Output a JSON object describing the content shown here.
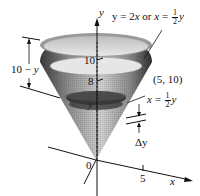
{
  "diagram": {
    "type": "solid-of-revolution-cone",
    "colors": {
      "background": "#ffffff",
      "ink": "#111111",
      "cone_dark": "#3a3a3a",
      "cone_mid": "#8a8a8a",
      "cone_light": "#cfcfcf",
      "disk_top": "#e6e6e6",
      "slice": "#262626"
    },
    "axes": {
      "y_label": "y",
      "x_label": "x",
      "origin_label": "0",
      "y_ticks": [
        "8",
        "10"
      ],
      "x_ticks": [
        "5"
      ]
    },
    "labels": {
      "line_eq_lhs": "y = 2",
      "line_eq_x": "x",
      "line_eq_or": " or ",
      "line_eq_x2": "x",
      "line_eq_eq": " = ",
      "line_eq_num": "1",
      "line_eq_den": "2",
      "line_eq_y": "y",
      "point": "(5, 10)",
      "shell_x": "x",
      "shell_eq": " = ",
      "shell_num": "1",
      "shell_den": "2",
      "shell_y": "y",
      "slice_inner_y": "y",
      "height_ten": "10 − ",
      "height_y": "y",
      "delta_y": "Δy"
    }
  }
}
